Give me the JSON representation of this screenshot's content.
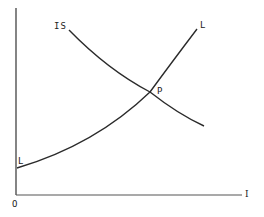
{
  "diagram": {
    "type": "IS-LM economic diagram",
    "origin_label": "O",
    "x_axis_label": "I",
    "curves": [
      {
        "name": "IS",
        "label": "IS",
        "shape": "downward-sloping convex"
      },
      {
        "name": "LM",
        "start_label": "L",
        "end_label": "L",
        "shape": "upward-sloping convex"
      }
    ],
    "intersection_label": "P",
    "colors": {
      "line": "#2b2b2b",
      "background": "#ffffff"
    }
  }
}
